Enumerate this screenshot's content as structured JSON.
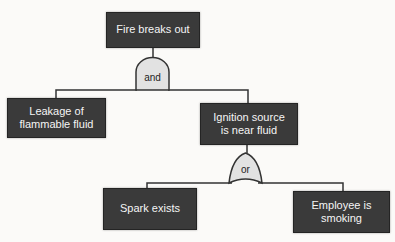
{
  "diagram": {
    "type": "fault-tree",
    "nodes": {
      "fire": {
        "label": "Fire breaks out"
      },
      "leakage": {
        "label": "Leakage of\nflammable fluid"
      },
      "ignition": {
        "label": "Ignition source\nis near fluid"
      },
      "spark": {
        "label": "Spark exists"
      },
      "employee": {
        "label": "Employee is\nsmoking"
      }
    },
    "gates": {
      "and": {
        "type": "AND",
        "label": "and"
      },
      "or": {
        "type": "OR",
        "label": "or"
      }
    },
    "edges": [
      {
        "from": "fire",
        "gate": "and",
        "to": [
          "leakage",
          "ignition"
        ]
      },
      {
        "from": "ignition",
        "gate": "or",
        "to": [
          "spark",
          "employee"
        ]
      }
    ]
  },
  "colors": {
    "node_fill": "#3a3a3a",
    "node_text": "#f5f5f5",
    "gate_fill": "#e2e2e2",
    "gate_text": "#222222",
    "line": "#333333",
    "background": "#fbfaf8"
  }
}
